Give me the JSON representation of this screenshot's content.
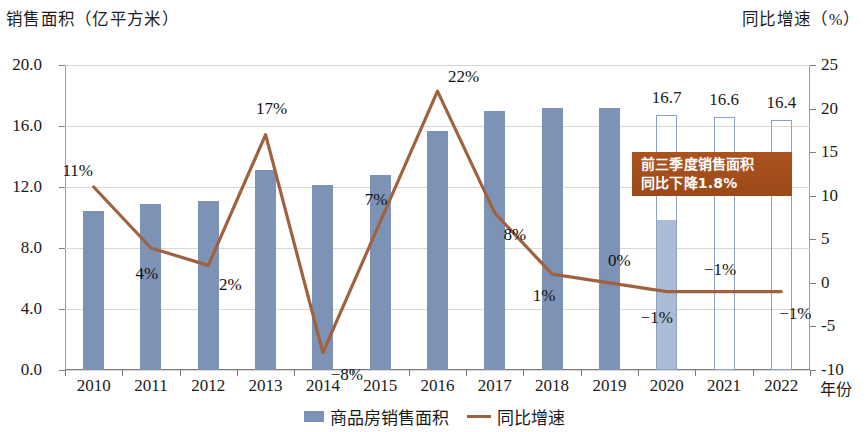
{
  "chart_data": {
    "type": "bar",
    "title": "",
    "left_axis_title": "销售面积（亿平方米）",
    "right_axis_title": "同比增速（%）",
    "xlabel": "年份",
    "categories": [
      "2010",
      "2011",
      "2012",
      "2013",
      "2014",
      "2015",
      "2016",
      "2017",
      "2018",
      "2019",
      "2020",
      "2021",
      "2022"
    ],
    "ylim": [
      0.0,
      20.0
    ],
    "yticks": [
      "0.0",
      "4.0",
      "8.0",
      "12.0",
      "16.0",
      "20.0"
    ],
    "ytick_values": [
      0.0,
      4.0,
      8.0,
      12.0,
      16.0,
      20.0
    ],
    "y2lim": [
      -10,
      25
    ],
    "y2ticks": [
      "-10",
      "-5",
      "0",
      "5",
      "10",
      "15",
      "20",
      "25"
    ],
    "y2tick_values": [
      -10,
      -5,
      0,
      5,
      10,
      15,
      20,
      25
    ],
    "grid": true,
    "legend_position": "bottom-center",
    "series": [
      {
        "name": "商品房销售面积",
        "type": "bar",
        "axis": "left",
        "color": "#7d93b5",
        "values": [
          10.4,
          10.9,
          11.1,
          13.1,
          12.1,
          12.8,
          15.7,
          17.0,
          17.2,
          17.2,
          16.7,
          16.6,
          16.4
        ],
        "styles": [
          "solid",
          "solid",
          "solid",
          "solid",
          "solid",
          "solid",
          "solid",
          "solid",
          "solid",
          "solid",
          "hollow",
          "hollow",
          "hollow"
        ],
        "data_labels": [
          "",
          "",
          "",
          "",
          "",
          "",
          "",
          "",
          "",
          "",
          "16.7",
          "16.6",
          "16.4"
        ],
        "partial_fill": {
          "category": "2020",
          "value": 9.8
        }
      },
      {
        "name": "同比增速",
        "type": "line",
        "axis": "right",
        "color": "#a0613f",
        "values": [
          11,
          4,
          2,
          17,
          -8,
          7,
          22,
          8,
          1,
          0,
          -1,
          -1,
          -1
        ],
        "data_labels": [
          "11%",
          "4%",
          "2%",
          "17%",
          "−8%",
          "7%",
          "22%",
          "8%",
          "1%",
          "0%",
          "−1%",
          "−1%",
          "−1%"
        ]
      }
    ],
    "annotations": [
      {
        "name": "callout",
        "line1": "前三季度销售面积",
        "line2": "同比下降1.8%",
        "color": "#a34d1c",
        "text_color": "#ffffff"
      }
    ],
    "legend": [
      {
        "label": "商品房销售面积",
        "marker": "bar-swatch",
        "color": "#7d93b5"
      },
      {
        "label": "同比增速",
        "marker": "line-swatch",
        "color": "#a0613f"
      }
    ]
  }
}
